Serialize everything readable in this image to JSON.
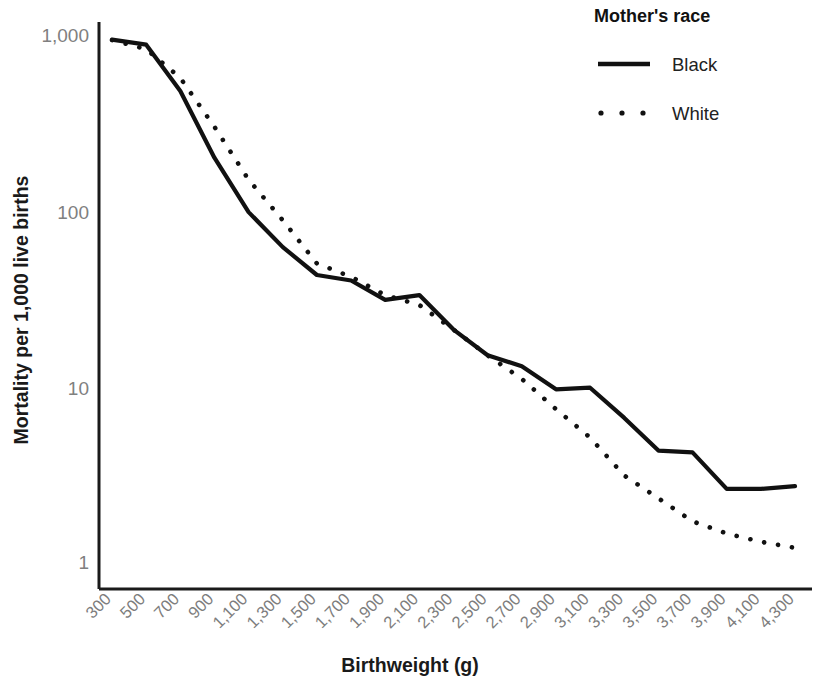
{
  "chart_data": {
    "type": "line",
    "title": "",
    "xlabel": "Birthweight (g)",
    "ylabel": "Mortality per 1,000 live births",
    "yscale": "log",
    "ylim": [
      0.8,
      1200
    ],
    "ytick_labels": [
      "1,000",
      "100",
      "10",
      "1"
    ],
    "ytick_values": [
      1000,
      100,
      10,
      1
    ],
    "grid": false,
    "legend_title": "Mother's race",
    "legend_position": "top-right",
    "xtick_labels": [
      "300",
      "500",
      "700",
      "900",
      "1,100",
      "1,300",
      "1,500",
      "1,700",
      "1,900",
      "2,100",
      "2,300",
      "2,500",
      "2,700",
      "2,900",
      "3,100",
      "3,300",
      "3,500",
      "3,700",
      "3,900",
      "4,100",
      "4,300"
    ],
    "x": [
      300,
      500,
      700,
      900,
      1100,
      1300,
      1500,
      1700,
      1900,
      2100,
      2300,
      2500,
      2700,
      2900,
      3100,
      3300,
      3500,
      3700,
      3900,
      4100,
      4300
    ],
    "series": [
      {
        "name": "Black",
        "style": "solid",
        "color": "#111111",
        "values": [
          940,
          880,
          480,
          200,
          98,
          62,
          43,
          40,
          31,
          33,
          21,
          15,
          13,
          9.6,
          9.8,
          6.6,
          4.3,
          4.2,
          2.6,
          2.6,
          2.7
        ]
      },
      {
        "name": "White",
        "style": "dotted",
        "color": "#111111",
        "values": [
          935,
          830,
          570,
          300,
          150,
          88,
          50,
          42,
          33,
          29,
          21,
          15,
          11,
          7.4,
          5.1,
          3.1,
          2.3,
          1.7,
          1.45,
          1.3,
          1.2
        ]
      }
    ]
  },
  "legend": {
    "title": "Mother's race",
    "entries": [
      {
        "label": "Black",
        "marker": "solid-line-swatch"
      },
      {
        "label": "White",
        "marker": "dotted-line-swatch"
      }
    ]
  },
  "axes": {
    "x_title": "Birthweight (g)",
    "y_title": "Mortality per 1,000 live births"
  }
}
